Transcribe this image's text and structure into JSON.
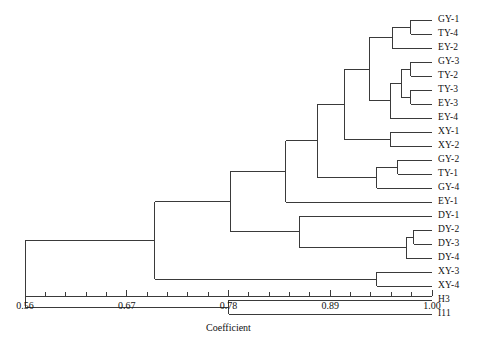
{
  "figure": {
    "type": "dendrogram",
    "axis_title": "Coefficient",
    "width": 481,
    "height": 351,
    "line_color": "#3a3a3a"
  },
  "axis": {
    "min": 0.56,
    "max": 1.0,
    "x_left_px": 25,
    "x_right_px": 432,
    "y_px": 296,
    "tick_labels": [
      "0.56",
      "0.67",
      "0.78",
      "0.89",
      "1.00"
    ],
    "tick_values": [
      0.56,
      0.67,
      0.78,
      0.89,
      1.0
    ],
    "minor_tick_count_between": 4
  },
  "leaves": [
    {
      "label": "GY-1",
      "y": 20
    },
    {
      "label": "TY-4",
      "y": 34
    },
    {
      "label": "EY-2",
      "y": 48
    },
    {
      "label": "GY-3",
      "y": 62
    },
    {
      "label": "TY-2",
      "y": 76
    },
    {
      "label": "TY-3",
      "y": 90
    },
    {
      "label": "EY-3",
      "y": 104
    },
    {
      "label": "EY-4",
      "y": 118
    },
    {
      "label": "XY-1",
      "y": 132
    },
    {
      "label": "XY-2",
      "y": 146
    },
    {
      "label": "GY-2",
      "y": 160
    },
    {
      "label": "TY-1",
      "y": 174
    },
    {
      "label": "GY-4",
      "y": 188
    },
    {
      "label": "EY-1",
      "y": 202
    },
    {
      "label": "DY-1",
      "y": 216
    },
    {
      "label": "DY-2",
      "y": 230
    },
    {
      "label": "DY-3",
      "y": 244
    },
    {
      "label": "DY-4",
      "y": 258
    },
    {
      "label": "XY-3",
      "y": 272
    },
    {
      "label": "XY-4",
      "y": 286
    },
    {
      "label": "H3",
      "y": 300
    },
    {
      "label": "I11",
      "y": 314
    }
  ],
  "chart_data": {
    "type": "dendrogram",
    "title": "",
    "xlabel": "Coefficient",
    "ylabel": "",
    "xlim": [
      0.56,
      1.0
    ],
    "grid": false,
    "legend": "none",
    "leaf_order": [
      "GY-1",
      "TY-4",
      "EY-2",
      "GY-3",
      "TY-2",
      "TY-3",
      "EY-3",
      "EY-4",
      "XY-1",
      "XY-2",
      "GY-2",
      "TY-1",
      "GY-4",
      "EY-1",
      "DY-1",
      "DY-2",
      "DY-3",
      "DY-4",
      "XY-3",
      "XY-4",
      "H3",
      "I11"
    ],
    "merges": [
      {
        "name": "m1",
        "members": [
          "GY-1",
          "TY-4"
        ],
        "coefficient": 0.977
      },
      {
        "name": "m2",
        "members": [
          "m1",
          "EY-2"
        ],
        "coefficient": 0.957
      },
      {
        "name": "m3",
        "members": [
          "GY-3",
          "TY-2"
        ],
        "coefficient": 0.977
      },
      {
        "name": "m4",
        "members": [
          "TY-3",
          "EY-3"
        ],
        "coefficient": 0.977
      },
      {
        "name": "m5",
        "members": [
          "m3",
          "m4"
        ],
        "coefficient": 0.967
      },
      {
        "name": "m6",
        "members": [
          "m5",
          "EY-4"
        ],
        "coefficient": 0.955
      },
      {
        "name": "m7",
        "members": [
          "m2",
          "m6"
        ],
        "coefficient": 0.932
      },
      {
        "name": "m8",
        "members": [
          "XY-1",
          "XY-2"
        ],
        "coefficient": 0.955
      },
      {
        "name": "m9",
        "members": [
          "m7",
          "m8"
        ],
        "coefficient": 0.905
      },
      {
        "name": "m10",
        "members": [
          "GY-2",
          "TY-1"
        ],
        "coefficient": 0.963
      },
      {
        "name": "m11",
        "members": [
          "m10",
          "GY-4"
        ],
        "coefficient": 0.94
      },
      {
        "name": "m12",
        "members": [
          "m9",
          "m11"
        ],
        "coefficient": 0.876
      },
      {
        "name": "m13",
        "members": [
          "m12",
          "EY-1"
        ],
        "coefficient": 0.842
      },
      {
        "name": "m14",
        "members": [
          "DY-2",
          "DY-3"
        ],
        "coefficient": 0.98
      },
      {
        "name": "m15",
        "members": [
          "m14",
          "DY-4"
        ],
        "coefficient": 0.972
      },
      {
        "name": "m16",
        "members": [
          "DY-1",
          "m15"
        ],
        "coefficient": 0.857
      },
      {
        "name": "m17",
        "members": [
          "m13",
          "m16"
        ],
        "coefficient": 0.782
      },
      {
        "name": "m18",
        "members": [
          "XY-3",
          "XY-4"
        ],
        "coefficient": 0.94
      },
      {
        "name": "m19",
        "members": [
          "m17",
          "m18"
        ],
        "coefficient": 0.7
      },
      {
        "name": "m20",
        "members": [
          "H3",
          "I11"
        ],
        "coefficient": 0.78
      },
      {
        "name": "m21",
        "members": [
          "m19",
          "m20"
        ],
        "coefficient": 0.56
      }
    ]
  }
}
